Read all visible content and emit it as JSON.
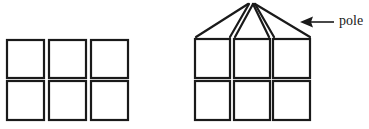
{
  "diagram": {
    "left_figure": {
      "description": "3x2 grid of square panels",
      "rows": 2,
      "cols": 3,
      "cells": [
        {
          "x": 7,
          "y": 40,
          "w": 37,
          "h": 38
        },
        {
          "x": 49,
          "y": 40,
          "w": 37,
          "h": 38
        },
        {
          "x": 91,
          "y": 40,
          "w": 37,
          "h": 38
        },
        {
          "x": 7,
          "y": 81,
          "w": 37,
          "h": 39
        },
        {
          "x": 49,
          "y": 81,
          "w": 37,
          "h": 39
        },
        {
          "x": 91,
          "y": 81,
          "w": 37,
          "h": 39
        }
      ]
    },
    "right_figure": {
      "description": "3x2 grid of square panels with lines converging to a pole",
      "rows": 2,
      "cols": 3,
      "cells": [
        {
          "x": 195,
          "y": 39,
          "w": 35,
          "h": 39
        },
        {
          "x": 234,
          "y": 39,
          "w": 36,
          "h": 39
        },
        {
          "x": 273,
          "y": 39,
          "w": 37,
          "h": 39
        },
        {
          "x": 195,
          "y": 81,
          "w": 35,
          "h": 39
        },
        {
          "x": 234,
          "y": 81,
          "w": 36,
          "h": 39
        },
        {
          "x": 273,
          "y": 81,
          "w": 37,
          "h": 39
        }
      ],
      "pole_point": {
        "x": 251,
        "y": 4
      }
    },
    "annotation": {
      "label": "pole",
      "arrow_direction": "left"
    },
    "stroke_color": "#1a1a1a",
    "background_color": "#ffffff"
  }
}
